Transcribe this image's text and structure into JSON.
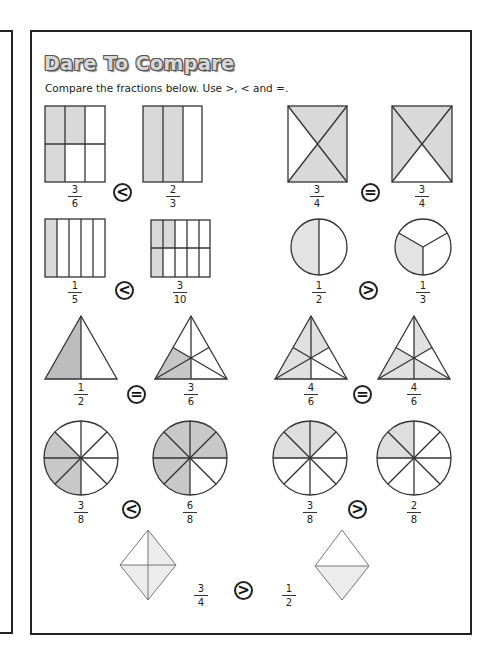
{
  "worksheet": {
    "title": "Dare To Compare",
    "instructions": "Compare the fractions below. Use >, < and =.",
    "colors": {
      "shade": "#d9d9d9",
      "line": "#333333",
      "frame": "#222222"
    },
    "problems": [
      {
        "left": {
          "shape": "rectangle-grid-2x3",
          "num": "3",
          "den": "6"
        },
        "symbol": "<",
        "right": {
          "shape": "rectangle-columns-3",
          "num": "2",
          "den": "3"
        }
      },
      {
        "left": {
          "shape": "rectangle-diagonals",
          "num": "3",
          "den": "4"
        },
        "symbol": "=",
        "right": {
          "shape": "rectangle-diagonals",
          "num": "3",
          "den": "4"
        }
      },
      {
        "left": {
          "shape": "rectangle-columns-5",
          "num": "1",
          "den": "5"
        },
        "symbol": "<",
        "right": {
          "shape": "rectangle-grid-2x5",
          "num": "3",
          "den": "10"
        }
      },
      {
        "left": {
          "shape": "circle-halves",
          "num": "1",
          "den": "2"
        },
        "symbol": ">",
        "right": {
          "shape": "circle-thirds",
          "num": "1",
          "den": "3"
        }
      },
      {
        "left": {
          "shape": "triangle-halves",
          "num": "1",
          "den": "2"
        },
        "symbol": "=",
        "right": {
          "shape": "triangle-sixths",
          "num": "3",
          "den": "6"
        }
      },
      {
        "left": {
          "shape": "triangle-sixths",
          "num": "4",
          "den": "6"
        },
        "symbol": "=",
        "right": {
          "shape": "triangle-sixths",
          "num": "4",
          "den": "6"
        }
      },
      {
        "left": {
          "shape": "circle-eighths",
          "num": "3",
          "den": "8"
        },
        "symbol": "<",
        "right": {
          "shape": "circle-eighths",
          "num": "6",
          "den": "8"
        }
      },
      {
        "left": {
          "shape": "circle-eighths",
          "num": "3",
          "den": "8"
        },
        "symbol": ">",
        "right": {
          "shape": "circle-eighths",
          "num": "2",
          "den": "8"
        }
      },
      {
        "left": {
          "shape": "diamond-quarters",
          "num": "3",
          "den": "4"
        },
        "symbol": ">",
        "right": {
          "shape": "diamond-halves",
          "num": "1",
          "den": "2"
        }
      }
    ]
  }
}
